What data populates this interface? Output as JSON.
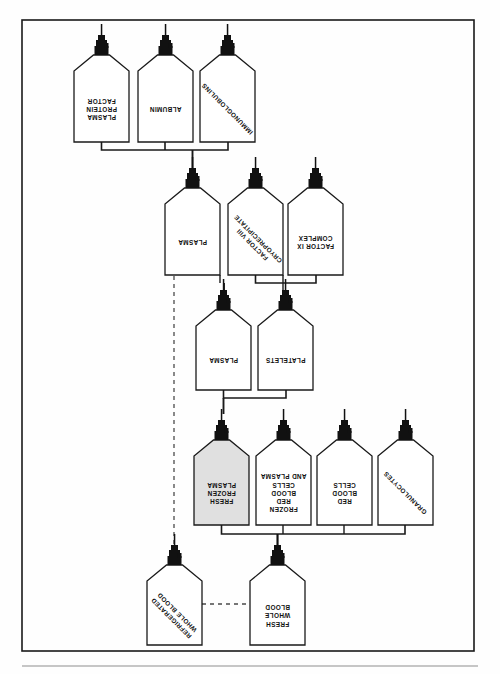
{
  "figure": {
    "orientation_note": "page printed upside-down; all labels rotated 180 degrees",
    "border_color": "#1a1a1a",
    "bottle_fill": "#ffffff",
    "bottle_stroke": "#1a1a1a",
    "cap_color": "#111111",
    "highlight_fill": "#e0e0e0",
    "connector_color": "#1a1a1a",
    "dashed_color": "#4a4a4a"
  },
  "rows": [
    {
      "id": "row-plasma-derivatives",
      "bottles": [
        {
          "id": "plasma-protein-factor",
          "lines": [
            "PLASMA",
            "PROTEIN",
            "FACTOR"
          ],
          "orientation": "rotated",
          "shaded": false,
          "x": 74,
          "y": 55,
          "w": 55,
          "h": 87
        },
        {
          "id": "albumin",
          "lines": [
            "ALBUMIN"
          ],
          "orientation": "rotated",
          "shaded": false,
          "x": 138,
          "y": 55,
          "w": 55,
          "h": 87
        },
        {
          "id": "immunoglobulins",
          "lines": [
            "IMMUNOGLOBULINS"
          ],
          "orientation": "diagonal",
          "shaded": false,
          "x": 200,
          "y": 55,
          "w": 55,
          "h": 87
        }
      ]
    },
    {
      "id": "row-plasma-fractions",
      "bottles": [
        {
          "id": "plasma-2",
          "lines": [
            "PLASMA"
          ],
          "orientation": "rotated",
          "shaded": false,
          "x": 165,
          "y": 188,
          "w": 55,
          "h": 87
        },
        {
          "id": "factor-viii-cryoprecipitate",
          "lines": [
            "FACTOR VIII",
            "CRYOPRECIPITATE"
          ],
          "orientation": "diagonal",
          "shaded": false,
          "x": 228,
          "y": 188,
          "w": 55,
          "h": 87
        },
        {
          "id": "factor-ix-complex",
          "lines": [
            "FACTOR IX",
            "COMPLEX"
          ],
          "orientation": "rotated",
          "shaded": false,
          "x": 288,
          "y": 188,
          "w": 55,
          "h": 87
        }
      ]
    },
    {
      "id": "row-plasma-platelets",
      "bottles": [
        {
          "id": "plasma-3",
          "lines": [
            "PLASMA"
          ],
          "orientation": "rotated",
          "shaded": false,
          "x": 196,
          "y": 310,
          "w": 55,
          "h": 80
        },
        {
          "id": "platelets",
          "lines": [
            "PLATELETS"
          ],
          "orientation": "rotated",
          "shaded": false,
          "x": 258,
          "y": 310,
          "w": 55,
          "h": 80
        }
      ]
    },
    {
      "id": "row-primary-components",
      "bottles": [
        {
          "id": "fresh-frozen-plasma",
          "lines": [
            "FRESH",
            "FROZEN",
            "PLASMA"
          ],
          "orientation": "rotated",
          "shaded": true,
          "x": 194,
          "y": 440,
          "w": 55,
          "h": 85
        },
        {
          "id": "frozen-red-blood-cells-and-plasma",
          "lines": [
            "FROZEN",
            "RED",
            "BLOOD",
            "CELLS",
            "AND PLASMA"
          ],
          "orientation": "rotated",
          "shaded": false,
          "x": 256,
          "y": 440,
          "w": 55,
          "h": 85
        },
        {
          "id": "red-blood-cells",
          "lines": [
            "RED",
            "BLOOD",
            "CELLS"
          ],
          "orientation": "rotated",
          "shaded": false,
          "x": 317,
          "y": 440,
          "w": 55,
          "h": 85
        },
        {
          "id": "granulocytes",
          "lines": [
            "GRANULOCYTES"
          ],
          "orientation": "diagonal",
          "shaded": false,
          "x": 378,
          "y": 440,
          "w": 55,
          "h": 85
        }
      ]
    },
    {
      "id": "row-whole-blood",
      "bottles": [
        {
          "id": "refrigerated-whole-blood",
          "lines": [
            "REFRIGERATED",
            "WHOLE BLOOD"
          ],
          "orientation": "diagonal",
          "shaded": false,
          "x": 147,
          "y": 565,
          "w": 55,
          "h": 80
        },
        {
          "id": "fresh-whole-blood",
          "lines": [
            "FRESH",
            "WHOLE",
            "BLOOD"
          ],
          "orientation": "rotated",
          "shaded": false,
          "x": 250,
          "y": 565,
          "w": 55,
          "h": 80
        }
      ]
    }
  ]
}
